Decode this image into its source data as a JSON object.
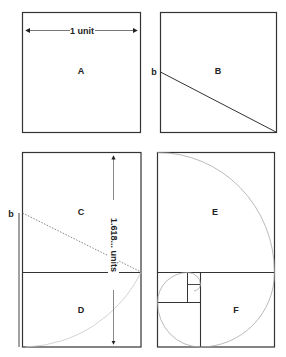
{
  "diagram": {
    "colors": {
      "stroke": "#333333",
      "light_stroke": "#aaaaaa",
      "arc": "#bdbdbd",
      "dotted": "#777777",
      "text": "#222222"
    },
    "panels": [
      {
        "id": "A",
        "label": "A",
        "dimension_label": "1 unit"
      },
      {
        "id": "B",
        "label": "B",
        "point_label": "b"
      },
      {
        "id": "C",
        "label": "C",
        "point_label": "b",
        "dimension_label": "1.618... units"
      },
      {
        "id": "D",
        "label": "D"
      },
      {
        "id": "E",
        "label": "E"
      },
      {
        "id": "F",
        "label": "F"
      }
    ]
  }
}
